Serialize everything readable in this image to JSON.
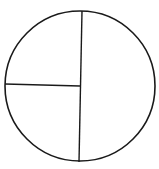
{
  "diagram": {
    "type": "fraction-circle",
    "parts": [
      {
        "name": "right-half",
        "fraction": "1/2"
      },
      {
        "name": "top-left-quarter",
        "fraction": "1/4"
      },
      {
        "name": "bottom-left-quarter",
        "fraction": "1/4"
      }
    ],
    "stroke_color": "#1a1a1a",
    "fill_color": "#ffffff"
  }
}
